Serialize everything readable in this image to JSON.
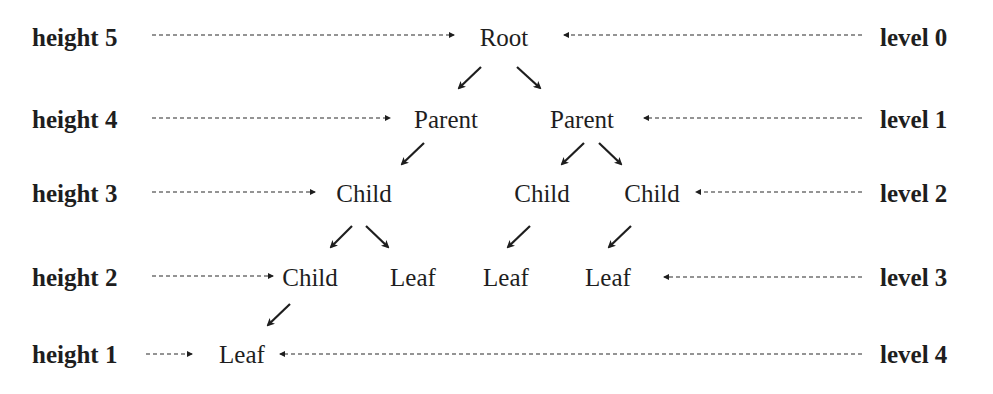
{
  "heights": [
    {
      "label": "height 5",
      "y": 37
    },
    {
      "label": "height 4",
      "y": 119
    },
    {
      "label": "height 3",
      "y": 193
    },
    {
      "label": "height 2",
      "y": 277
    },
    {
      "label": "height 1",
      "y": 354
    }
  ],
  "levels": [
    {
      "label": "level 0",
      "y": 37
    },
    {
      "label": "level 1",
      "y": 119
    },
    {
      "label": "level 2",
      "y": 193
    },
    {
      "label": "level 3",
      "y": 277
    },
    {
      "label": "level 4",
      "y": 354
    }
  ],
  "nodes": [
    {
      "id": "root",
      "label": "Root",
      "x": 504,
      "y": 37,
      "level": 0
    },
    {
      "id": "parent-left",
      "label": "Parent",
      "x": 446,
      "y": 119,
      "level": 1
    },
    {
      "id": "parent-right",
      "label": "Parent",
      "x": 582,
      "y": 119,
      "level": 1
    },
    {
      "id": "child-l2-a",
      "label": "Child",
      "x": 364,
      "y": 193,
      "level": 2
    },
    {
      "id": "child-l2-b",
      "label": "Child",
      "x": 542,
      "y": 193,
      "level": 2
    },
    {
      "id": "child-l2-c",
      "label": "Child",
      "x": 652,
      "y": 193,
      "level": 2
    },
    {
      "id": "child-l3-a",
      "label": "Child",
      "x": 310,
      "y": 277,
      "level": 3
    },
    {
      "id": "leaf-l3-a",
      "label": "Leaf",
      "x": 413,
      "y": 277,
      "level": 3
    },
    {
      "id": "leaf-l3-b",
      "label": "Leaf",
      "x": 506,
      "y": 277,
      "level": 3
    },
    {
      "id": "leaf-l3-c",
      "label": "Leaf",
      "x": 608,
      "y": 277,
      "level": 3
    },
    {
      "id": "leaf-l4-a",
      "label": "Leaf",
      "x": 242,
      "y": 354,
      "level": 4
    }
  ],
  "edges": [
    {
      "from": "root",
      "to": "parent-left"
    },
    {
      "from": "root",
      "to": "parent-right"
    },
    {
      "from": "parent-left",
      "to": "child-l2-a"
    },
    {
      "from": "parent-right",
      "to": "child-l2-b"
    },
    {
      "from": "parent-right",
      "to": "child-l2-c"
    },
    {
      "from": "child-l2-a",
      "to": "child-l3-a"
    },
    {
      "from": "child-l2-a",
      "to": "leaf-l3-a"
    },
    {
      "from": "child-l2-b",
      "to": "leaf-l3-b"
    },
    {
      "from": "child-l2-c",
      "to": "leaf-l3-c"
    },
    {
      "from": "child-l3-a",
      "to": "leaf-l4-a"
    }
  ],
  "colors": {
    "ink": "#1e1e1e",
    "background": "#ffffff"
  }
}
